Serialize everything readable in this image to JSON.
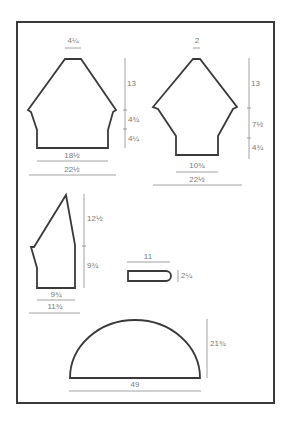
{
  "diagram": {
    "type": "knitting schematic",
    "colors": {
      "outline": "#3a3a3a",
      "dimension": "#8a8a8a",
      "label": "#7a7a7a"
    },
    "pieces": [
      {
        "name": "back",
        "labels": {
          "top_width": "4¼",
          "upper_height": "13",
          "mid_height": "4¾",
          "lower_height": "4¼",
          "bottom_width": "18½",
          "full_width": "22½"
        }
      },
      {
        "name": "front",
        "labels": {
          "top_width": "2",
          "upper_height": "13",
          "mid_height": "7½",
          "lower_height": "4¾",
          "bottom_width": "10¾",
          "full_width": "22½"
        }
      },
      {
        "name": "sleeve",
        "labels": {
          "upper_height": "12½",
          "lower_height": "9¾",
          "bottom_width": "9¾",
          "full_width": "11¾"
        }
      },
      {
        "name": "strap",
        "labels": {
          "width": "11",
          "height": "2¼"
        }
      },
      {
        "name": "half-circle",
        "labels": {
          "height": "21¾",
          "width": "49"
        }
      }
    ]
  }
}
